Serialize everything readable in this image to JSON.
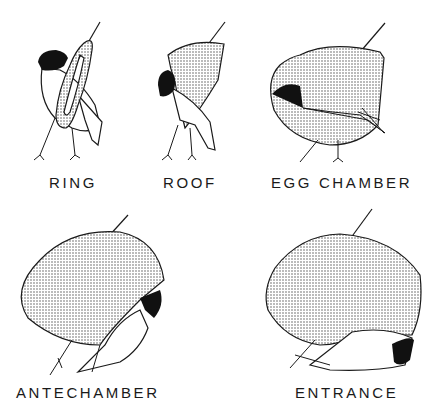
{
  "figure": {
    "title": "",
    "stages": [
      {
        "id": "ring",
        "label": "RING"
      },
      {
        "id": "roof",
        "label": "ROOF"
      },
      {
        "id": "egg_chamber",
        "label": "EGG CHAMBER"
      },
      {
        "id": "antechamber",
        "label": "ANTECHAMBER"
      },
      {
        "id": "entrance",
        "label": "ENTRANCE"
      }
    ],
    "colors": {
      "ink": "#1a1a1a",
      "stipple": "#6b6b6b",
      "background": "#ffffff",
      "bird_head": "#111111"
    }
  }
}
